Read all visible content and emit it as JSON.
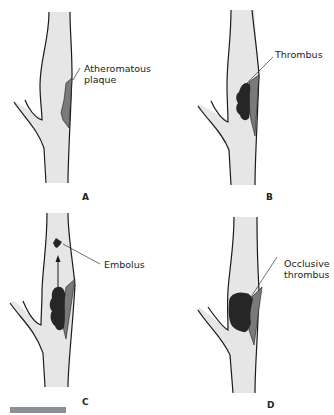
{
  "figure": {
    "panels": [
      {
        "id": "A",
        "letter": "A",
        "label_line1": "Atheromatous",
        "label_line2": "plaque"
      },
      {
        "id": "B",
        "letter": "B",
        "label_line1": "Thrombus",
        "label_line2": ""
      },
      {
        "id": "C",
        "letter": "C",
        "label_line1": "Embolus",
        "label_line2": ""
      },
      {
        "id": "D",
        "letter": "D",
        "label_line1": "Occlusive",
        "label_line2": "thrombus"
      }
    ],
    "colors": {
      "vessel_fill": "#e6e6e6",
      "vessel_outline": "#1a1a1a",
      "plaque": "#7a7a7a",
      "thrombus": "#262626"
    }
  }
}
